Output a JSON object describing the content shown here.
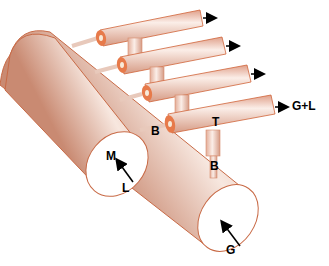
{
  "diagram": {
    "labels": {
      "main": "M",
      "inlet_main": "L",
      "gas_inlet": "G",
      "branch": "B",
      "branch_lower": "B",
      "tee": "T",
      "outlet": "G+L"
    },
    "colors": {
      "pipe_light": "#f6e4dc",
      "pipe_mid": "#e8b8a4",
      "pipe_edge": "#d0643a",
      "pipe_end": "#e77a4a",
      "arrow": "#000000"
    },
    "pipes": {
      "outlet_count": 4
    }
  }
}
